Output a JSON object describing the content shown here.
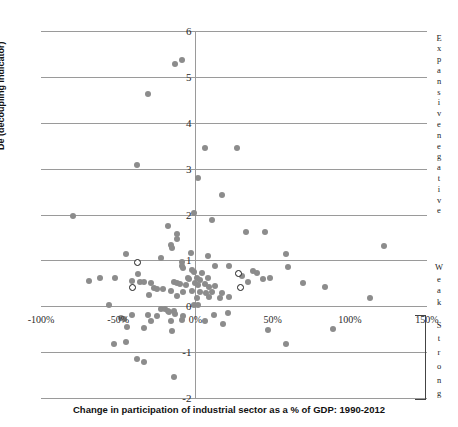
{
  "chart_data": {
    "type": "scatter",
    "title": "",
    "xlabel": "Change in participation of industrial sector as a % of GDP: 1990-2012",
    "ylabel": "De (decoupling indicator)",
    "xlim": [
      -100,
      150
    ],
    "ylim": [
      -2,
      6
    ],
    "xticks": [
      "-100%",
      "-50%",
      "0%",
      "50%",
      "100%",
      "150%"
    ],
    "xtick_values": [
      -100,
      -50,
      0,
      50,
      100,
      150
    ],
    "yticks": [
      "-2",
      "-1",
      "0",
      "1",
      "2",
      "3",
      "4",
      "5",
      "6"
    ],
    "ytick_values": [
      -2,
      -1,
      0,
      1,
      2,
      3,
      4,
      5,
      6
    ],
    "grid": "horizontal",
    "legend": "none",
    "zone_labels": [
      {
        "name": "expansive-negative",
        "text": "Expansive negative",
        "y_range": [
          2,
          6
        ]
      },
      {
        "name": "weak",
        "text": "Weak",
        "y_range": [
          0,
          1
        ]
      },
      {
        "name": "strong",
        "text": "Strong",
        "y_range": [
          -2,
          -0.2
        ]
      }
    ],
    "marker_color": "#8c8c8c",
    "gridline_color": "#9a9a9a",
    "series": [
      {
        "name": "countries-filled",
        "marker": "filled-circle",
        "points": [
          [
            -13,
            5.28
          ],
          [
            -9,
            5.37
          ],
          [
            -31,
            4.62
          ],
          [
            6,
            3.44
          ],
          [
            27,
            3.45
          ],
          [
            -38,
            3.07
          ],
          [
            2,
            2.79
          ],
          [
            17,
            2.42
          ],
          [
            -1,
            2.03
          ],
          [
            -79,
            1.97
          ],
          [
            -18,
            1.75
          ],
          [
            11,
            1.89
          ],
          [
            -12,
            1.58
          ],
          [
            -12,
            1.46
          ],
          [
            -16,
            1.34
          ],
          [
            -15,
            1.26
          ],
          [
            33,
            1.62
          ],
          [
            45,
            1.61
          ],
          [
            122,
            1.32
          ],
          [
            -45,
            1.14
          ],
          [
            -22,
            1.05
          ],
          [
            -3,
            1.15
          ],
          [
            8,
            1.1
          ],
          [
            59,
            1.13
          ],
          [
            -9,
            0.97
          ],
          [
            -9,
            0.88
          ],
          [
            -8,
            0.83
          ],
          [
            13,
            0.88
          ],
          [
            22,
            0.87
          ],
          [
            60,
            0.85
          ],
          [
            -37,
            0.71
          ],
          [
            -2,
            0.79
          ],
          [
            -1,
            0.75
          ],
          [
            4,
            0.72
          ],
          [
            37,
            0.77
          ],
          [
            40,
            0.72
          ],
          [
            -52,
            0.62
          ],
          [
            -62,
            0.62
          ],
          [
            -5,
            0.62
          ],
          [
            -4,
            0.6
          ],
          [
            1,
            0.62
          ],
          [
            3,
            0.58
          ],
          [
            8,
            0.61
          ],
          [
            30,
            0.67
          ],
          [
            44,
            0.6
          ],
          [
            48,
            0.62
          ],
          [
            -69,
            0.55
          ],
          [
            -41,
            0.55
          ],
          [
            -36,
            0.52
          ],
          [
            -33,
            0.52
          ],
          [
            -29,
            0.5
          ],
          [
            -14,
            0.52
          ],
          [
            -12,
            0.5
          ],
          [
            -10,
            0.48
          ],
          [
            -6,
            0.47
          ],
          [
            0,
            0.5
          ],
          [
            2,
            0.47
          ],
          [
            6,
            0.48
          ],
          [
            9,
            0.42
          ],
          [
            13,
            0.45
          ],
          [
            34,
            0.52
          ],
          [
            70,
            0.5
          ],
          [
            -27,
            0.4
          ],
          [
            -25,
            0.38
          ],
          [
            -21,
            0.37
          ],
          [
            -16,
            0.34
          ],
          [
            -8,
            0.3
          ],
          [
            -2,
            0.33
          ],
          [
            3,
            0.3
          ],
          [
            7,
            0.28
          ],
          [
            11,
            0.3
          ],
          [
            17,
            0.28
          ],
          [
            84,
            0.42
          ],
          [
            -30,
            0.25
          ],
          [
            -12,
            0.22
          ],
          [
            1,
            0.18
          ],
          [
            9,
            0.2
          ],
          [
            16,
            0.18
          ],
          [
            22,
            0.2
          ],
          [
            113,
            0.18
          ],
          [
            -56,
            0.02
          ],
          [
            -1,
            0.03
          ],
          [
            2,
            0.02
          ],
          [
            -22,
            -0.05
          ],
          [
            -20,
            -0.07
          ],
          [
            -18,
            -0.1
          ],
          [
            -17,
            -0.13
          ],
          [
            -14,
            -0.1
          ],
          [
            -13,
            -0.16
          ],
          [
            -41,
            -0.18
          ],
          [
            -31,
            -0.2
          ],
          [
            -25,
            -0.22
          ],
          [
            -8,
            -0.22
          ],
          [
            12,
            -0.18
          ],
          [
            21,
            -0.14
          ],
          [
            -48,
            -0.25
          ],
          [
            -46,
            -0.27
          ],
          [
            -29,
            -0.32
          ],
          [
            -16,
            -0.33
          ],
          [
            -9,
            -0.3
          ],
          [
            6,
            -0.33
          ],
          [
            18,
            -0.38
          ],
          [
            -44,
            -0.45
          ],
          [
            -33,
            -0.48
          ],
          [
            -15,
            -0.55
          ],
          [
            47,
            -0.52
          ],
          [
            89,
            -0.5
          ],
          [
            -53,
            -0.82
          ],
          [
            -45,
            -0.78
          ],
          [
            59,
            -0.82
          ],
          [
            -38,
            -1.15
          ],
          [
            -33,
            -1.22
          ],
          [
            -14,
            -1.55
          ]
        ]
      },
      {
        "name": "countries-highlighted",
        "marker": "hollow-circle",
        "points": [
          [
            -38,
            0.95
          ],
          [
            -41,
            0.42
          ],
          [
            28,
            0.72
          ],
          [
            29,
            0.42
          ]
        ]
      }
    ]
  }
}
